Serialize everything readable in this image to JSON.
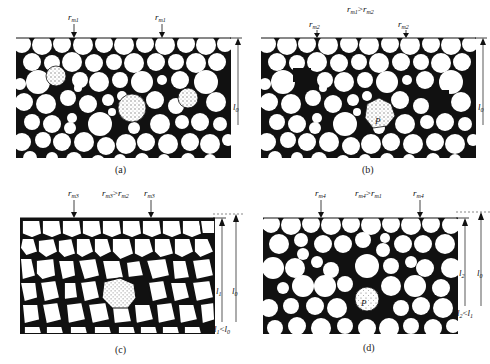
{
  "panels": [
    {
      "id": "a",
      "caption": "(a)",
      "top_labels": [
        "r_m1",
        "r_m1"
      ],
      "relation": "",
      "length_labels": [
        "l_0"
      ],
      "inequality": "",
      "special_particles": [
        "r_m1",
        "r_m1",
        "r_m1"
      ],
      "pore_labels": []
    },
    {
      "id": "b",
      "caption": "(b)",
      "top_labels": [
        "r_m2",
        "r_m2"
      ],
      "relation": "r_m1 > r_m2",
      "length_labels": [
        "l_0"
      ],
      "inequality": "",
      "special_particles": [
        "r_m2 / P"
      ],
      "pore_labels": [
        "LP",
        "LP"
      ]
    },
    {
      "id": "c",
      "caption": "(c)",
      "top_labels": [
        "r_m3",
        "r_m3"
      ],
      "relation": "r_m3 > r_m2",
      "length_labels": [
        "l_1",
        "l_0"
      ],
      "inequality": "l_1 < l_0",
      "special_particles": [
        "r_m3"
      ],
      "pore_labels": []
    },
    {
      "id": "d",
      "caption": "(d)",
      "top_labels": [
        "r_m4",
        "r_m4"
      ],
      "relation": "r_m4 > r_m1",
      "length_labels": [
        "l_2",
        "l_0"
      ],
      "inequality": "l_2 < l_1",
      "special_particles": [
        "r_m4 / P"
      ],
      "pore_labels": []
    }
  ],
  "text": {
    "a_caption": "(a)",
    "b_caption": "(b)",
    "c_caption": "(c)",
    "d_caption": "(d)",
    "rm1": "r",
    "sub_m1": "m1",
    "sub_m2": "m2",
    "sub_m3": "m3",
    "sub_m4": "m4",
    "gt": ">",
    "lt": "<",
    "l": "l",
    "sub_0": "0",
    "sub_1": "1",
    "sub_2": "2",
    "LP": "LP",
    "P": "P"
  },
  "colors": {
    "ink": "#111111",
    "paper": "#ffffff",
    "dots": "#777777"
  }
}
